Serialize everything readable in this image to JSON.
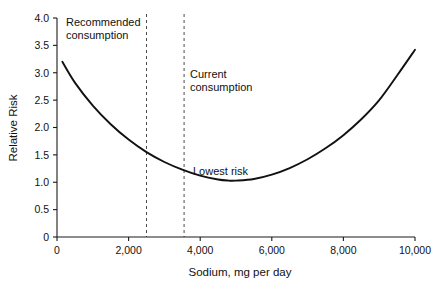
{
  "chart_data": {
    "type": "line",
    "title": "",
    "xlabel": "Sodium, mg per day",
    "ylabel": "Relative Risk",
    "xlim": [
      0,
      10000
    ],
    "ylim": [
      0,
      4.0
    ],
    "grid": false,
    "legend": "none",
    "x_ticks": [
      {
        "value": 0,
        "label": "0"
      },
      {
        "value": 2000,
        "label": "2,000"
      },
      {
        "value": 4000,
        "label": "4,000"
      },
      {
        "value": 6000,
        "label": "6,000"
      },
      {
        "value": 8000,
        "label": "8,000"
      },
      {
        "value": 10000,
        "label": "10,000"
      }
    ],
    "y_ticks": [
      {
        "value": 0,
        "label": "0"
      },
      {
        "value": 0.5,
        "label": "0.5"
      },
      {
        "value": 1.0,
        "label": "1.0"
      },
      {
        "value": 1.5,
        "label": "1.5"
      },
      {
        "value": 2.0,
        "label": "2.0"
      },
      {
        "value": 2.5,
        "label": "2.5"
      },
      {
        "value": 3.0,
        "label": "3.0"
      },
      {
        "value": 3.5,
        "label": "3.5"
      },
      {
        "value": 4.0,
        "label": "4.0"
      }
    ],
    "series": [
      {
        "name": "Relative risk curve",
        "x": [
          150,
          500,
          1000,
          1500,
          2000,
          2500,
          3000,
          3500,
          4000,
          4500,
          4800,
          5000,
          5500,
          6000,
          6500,
          7000,
          7500,
          8000,
          8500,
          9000,
          9500,
          10000
        ],
        "values": [
          3.2,
          2.82,
          2.4,
          2.06,
          1.78,
          1.55,
          1.37,
          1.23,
          1.12,
          1.05,
          1.03,
          1.03,
          1.06,
          1.14,
          1.26,
          1.42,
          1.62,
          1.86,
          2.15,
          2.5,
          2.95,
          3.42
        ]
      }
    ],
    "markers": [
      {
        "name": "recommended-consumption",
        "x": 2500,
        "style": "dashed-vertical"
      },
      {
        "name": "current-consumption",
        "x": 3550,
        "style": "dashed-vertical"
      }
    ],
    "annotations": [
      {
        "name": "recommended-consumption-label",
        "lines": [
          "Recommended",
          "consumption"
        ],
        "x_px": 66,
        "y_px": 26
      },
      {
        "name": "current-consumption-label",
        "lines": [
          "Current",
          "consumption"
        ],
        "x_px": 190,
        "y_px": 78
      },
      {
        "name": "lowest-risk-label",
        "lines": [
          "Lowest risk"
        ],
        "x_px": 193,
        "y_px": 175
      }
    ],
    "colors": {
      "curve": "#111111",
      "axis": "#1a1a1a",
      "marker_line": "#4a4a4a",
      "background": "#ffffff",
      "text": "#111111"
    }
  }
}
